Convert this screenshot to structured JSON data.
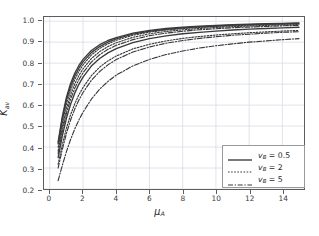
{
  "chart_data": {
    "type": "line",
    "title": "",
    "xlabel": "μ_A",
    "xlabel_base": "μ",
    "xlabel_sub": "A",
    "ylabel_base": "K",
    "ylabel_sub": "av",
    "xlim": [
      -0.35,
      15.3
    ],
    "ylim": [
      0.2,
      1.02
    ],
    "xticks": [
      0,
      2,
      4,
      6,
      8,
      10,
      12,
      14
    ],
    "xtick_labels": [
      "0",
      "2",
      "4",
      "6",
      "8",
      "10",
      "12",
      "14"
    ],
    "yticks": [
      0.2,
      0.3,
      0.4,
      0.5,
      0.6,
      0.7,
      0.8,
      0.9,
      1.0
    ],
    "ytick_labels": [
      "0.2",
      "0.3",
      "0.4",
      "0.5",
      "0.6",
      "0.7",
      "0.8",
      "0.9",
      "1.0"
    ],
    "grid": true,
    "grid_color": "#d6dce4",
    "axis_color": "#5d5d5d",
    "line_color": "#3a3a3a",
    "legend_position": "lower right",
    "legend": [
      {
        "label_base": "v",
        "label_sub": "B",
        "label_value": "= 0.5",
        "dash": "solid"
      },
      {
        "label_base": "v",
        "label_sub": "B",
        "label_value": "= 2",
        "dash": "dotted"
      },
      {
        "label_base": "v",
        "label_sub": "B",
        "label_value": "= 5",
        "dash": "dashdot"
      }
    ],
    "x": [
      0.5,
      0.75,
      1.0,
      1.25,
      1.5,
      1.75,
      2.0,
      2.5,
      3.0,
      3.5,
      4.0,
      5.0,
      6.0,
      7.0,
      8.0,
      9.0,
      10.0,
      11.0,
      12.0,
      13.0,
      14.0,
      15.0
    ],
    "series": [
      {
        "name": "vB = 0.5, a",
        "dash": "solid",
        "values": [
          0.424,
          0.545,
          0.638,
          0.703,
          0.752,
          0.789,
          0.818,
          0.86,
          0.888,
          0.908,
          0.922,
          0.943,
          0.956,
          0.965,
          0.971,
          0.976,
          0.98,
          0.983,
          0.986,
          0.988,
          0.99,
          0.992
        ]
      },
      {
        "name": "vB = 0.5, b",
        "dash": "solid",
        "values": [
          0.415,
          0.533,
          0.624,
          0.689,
          0.738,
          0.776,
          0.806,
          0.85,
          0.879,
          0.9,
          0.916,
          0.938,
          0.952,
          0.961,
          0.968,
          0.973,
          0.977,
          0.981,
          0.984,
          0.986,
          0.988,
          0.99
        ]
      },
      {
        "name": "vB = 0.5, c",
        "dash": "solid",
        "values": [
          0.35,
          0.452,
          0.537,
          0.604,
          0.657,
          0.699,
          0.733,
          0.786,
          0.822,
          0.849,
          0.869,
          0.898,
          0.917,
          0.93,
          0.94,
          0.947,
          0.953,
          0.958,
          0.962,
          0.965,
          0.968,
          0.971
        ]
      },
      {
        "name": "vB = 2, a",
        "dash": "dotted",
        "values": [
          0.4,
          0.515,
          0.605,
          0.671,
          0.722,
          0.761,
          0.792,
          0.839,
          0.87,
          0.892,
          0.909,
          0.933,
          0.948,
          0.958,
          0.965,
          0.97,
          0.975,
          0.978,
          0.981,
          0.984,
          0.986,
          0.988
        ]
      },
      {
        "name": "vB = 2, b",
        "dash": "dotted",
        "values": [
          0.382,
          0.493,
          0.582,
          0.649,
          0.701,
          0.741,
          0.773,
          0.822,
          0.855,
          0.879,
          0.897,
          0.923,
          0.94,
          0.951,
          0.959,
          0.965,
          0.97,
          0.974,
          0.977,
          0.98,
          0.982,
          0.984
        ]
      },
      {
        "name": "vB = 2, c",
        "dash": "dotted",
        "values": [
          0.318,
          0.411,
          0.49,
          0.554,
          0.606,
          0.649,
          0.684,
          0.74,
          0.781,
          0.811,
          0.834,
          0.868,
          0.89,
          0.906,
          0.918,
          0.927,
          0.934,
          0.94,
          0.945,
          0.949,
          0.953,
          0.956
        ]
      },
      {
        "name": "vB = 5, a",
        "dash": "dashdot",
        "values": [
          0.368,
          0.475,
          0.562,
          0.628,
          0.68,
          0.721,
          0.754,
          0.805,
          0.84,
          0.866,
          0.885,
          0.912,
          0.931,
          0.943,
          0.952,
          0.959,
          0.964,
          0.969,
          0.972,
          0.975,
          0.978,
          0.98
        ]
      },
      {
        "name": "vB = 5, b",
        "dash": "dashdot",
        "values": [
          0.3,
          0.388,
          0.465,
          0.529,
          0.581,
          0.624,
          0.66,
          0.718,
          0.76,
          0.792,
          0.817,
          0.853,
          0.877,
          0.895,
          0.908,
          0.918,
          0.926,
          0.933,
          0.938,
          0.943,
          0.947,
          0.95
        ]
      },
      {
        "name": "vB = 5, c",
        "dash": "dashdot",
        "values": [
          0.24,
          0.312,
          0.378,
          0.436,
          0.486,
          0.529,
          0.566,
          0.628,
          0.676,
          0.713,
          0.743,
          0.787,
          0.818,
          0.841,
          0.858,
          0.872,
          0.883,
          0.892,
          0.9,
          0.906,
          0.912,
          0.917
        ]
      }
    ]
  }
}
